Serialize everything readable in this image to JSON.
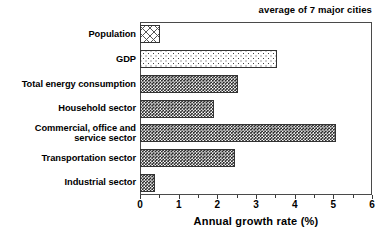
{
  "chart_data": {
    "type": "bar",
    "orientation": "horizontal",
    "title": "average of 7 major cities",
    "xlabel": "Annual growth rate (%)",
    "ylabel": "",
    "xlim": [
      0,
      6
    ],
    "xticks": [
      0,
      1,
      2,
      3,
      4,
      5,
      6
    ],
    "xticklabels": [
      "0",
      "1",
      "2",
      "3",
      "4",
      "5",
      "6"
    ],
    "grid": false,
    "legend": false,
    "categories": [
      "Population",
      "GDP",
      "Total energy consumption",
      "Household sector",
      "Commercial, office and service sector",
      "Transportation sector",
      "Industrial sector"
    ],
    "values": [
      0.52,
      3.55,
      2.53,
      1.92,
      5.08,
      2.46,
      0.38
    ],
    "bar_fills": [
      "cross-hatch",
      "sparse-dot",
      "dense-dot",
      "dense-dot",
      "dense-dot",
      "dense-dot",
      "dense-dot"
    ]
  },
  "labels": {
    "population": "Population",
    "gdp": "GDP",
    "total_energy": "Total energy consumption",
    "household": "Household sector",
    "commercial_line1": "Commercial, office and",
    "commercial_line2": "service sector",
    "transportation": "Transportation sector",
    "industrial": "Industrial sector"
  },
  "axis": {
    "title": "Annual growth rate (%)",
    "t0": "0",
    "t1": "1",
    "t2": "2",
    "t3": "3",
    "t4": "4",
    "t5": "5",
    "t6": "6"
  },
  "caption": {
    "text": "average of 7 major cities"
  },
  "colors": {
    "frame": "#4a4a4a",
    "bar_outline": "#333333",
    "text": "#000000",
    "background": "#ffffff"
  }
}
